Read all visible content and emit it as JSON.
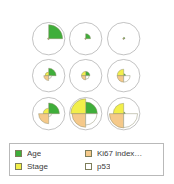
{
  "colors": {
    "age": "#3fae3a",
    "stage": "#f2ef4a",
    "ki67": "#f5c98a",
    "p53": "#ffffff",
    "circle_stroke": "#9a9a9a",
    "wedge_stroke": "#8a8a6a",
    "legend_border": "#b9b9b9",
    "text": "#3a3a3a"
  },
  "legend": {
    "items": [
      {
        "label": "Age",
        "key": "age",
        "swatch": "#3fae3a"
      },
      {
        "label": "Ki67 index…",
        "key": "ki67",
        "swatch": "#f5c98a"
      },
      {
        "label": "Stage",
        "key": "stage",
        "swatch": "#f2ef4a"
      },
      {
        "label": "p53",
        "key": "p53",
        "swatch": "#ffffff"
      }
    ]
  },
  "chart_data": {
    "type": "pie",
    "title": "",
    "subtitle": "",
    "grid": {
      "rows": 3,
      "cols": 3
    },
    "variables": [
      "Age",
      "Stage",
      "Ki67 index…",
      "p53"
    ],
    "quadrants": {
      "Age": "upper-right",
      "Stage": "upper-left",
      "Ki67 index…": "lower-left",
      "p53": "lower-right"
    },
    "legend_position": "bottom",
    "grid_on": false,
    "rlim": [
      0,
      1
    ],
    "cells": [
      {
        "row": 0,
        "col": 0,
        "values": {
          "Age": 0.86,
          "Stage": 0.06,
          "Ki67 index…": 0.06,
          "p53": 0.04
        }
      },
      {
        "row": 0,
        "col": 1,
        "values": {
          "Age": 0.3,
          "Stage": 0.05,
          "Ki67 index…": 0.05,
          "p53": 0.03
        }
      },
      {
        "row": 0,
        "col": 2,
        "values": {
          "Age": 0.08,
          "Stage": 0.05,
          "Ki67 index…": 0.05,
          "p53": 0.03
        }
      },
      {
        "row": 1,
        "col": 0,
        "values": {
          "Age": 0.46,
          "Stage": 0.22,
          "Ki67 index…": 0.3,
          "p53": 0.18
        }
      },
      {
        "row": 1,
        "col": 1,
        "values": {
          "Age": 0.26,
          "Stage": 0.26,
          "Ki67 index…": 0.26,
          "p53": 0.22
        }
      },
      {
        "row": 1,
        "col": 2,
        "values": {
          "Age": 0.12,
          "Stage": 0.4,
          "Ki67 index…": 0.4,
          "p53": 0.4
        }
      },
      {
        "row": 2,
        "col": 0,
        "values": {
          "Age": 0.66,
          "Stage": 0.34,
          "Ki67 index…": 0.62,
          "p53": 0.18
        }
      },
      {
        "row": 2,
        "col": 1,
        "values": {
          "Age": 0.72,
          "Stage": 0.92,
          "Ki67 index…": 0.84,
          "p53": 0.7
        }
      },
      {
        "row": 2,
        "col": 2,
        "values": {
          "Age": 0.1,
          "Stage": 0.64,
          "Ki67 index…": 0.88,
          "p53": 0.86
        }
      }
    ]
  }
}
